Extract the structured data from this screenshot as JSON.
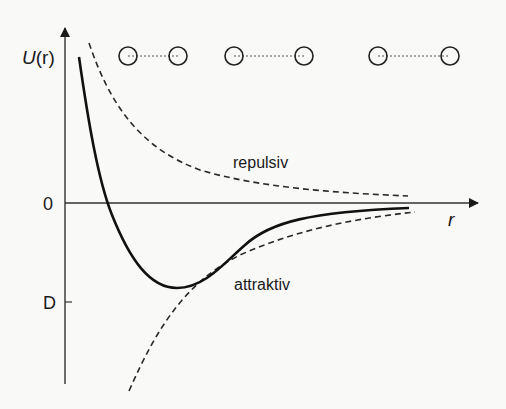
{
  "diagram": {
    "y_axis_label_main": "U",
    "y_axis_label_arg": "(r)",
    "x_axis_label": "r",
    "zero_label": "0",
    "depth_label": "D",
    "repulsive_label": "repulsiv",
    "attractive_label": "attraktiv",
    "colors": {
      "background": "#f9f9f7",
      "ink": "#1a1a1a",
      "dashed": "#2a2a2a"
    },
    "atom_pairs": [
      {
        "a": 128,
        "b": 178
      },
      {
        "a": 234,
        "b": 304
      },
      {
        "a": 378,
        "b": 450
      }
    ],
    "curves": [
      {
        "name": "total-potential",
        "style": "solid"
      },
      {
        "name": "repulsive-term",
        "style": "dashed"
      },
      {
        "name": "attractive-term",
        "style": "dashed"
      }
    ]
  }
}
